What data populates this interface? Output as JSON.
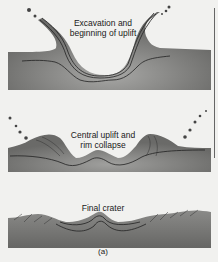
{
  "figure": {
    "stages": [
      {
        "label_line1": "Excavation and",
        "label_line2": "beginning of uplift"
      },
      {
        "label_line1": "Central uplift and",
        "label_line2": "rim collapse"
      },
      {
        "label_line1": "Final crater",
        "label_line2": ""
      }
    ],
    "caption": "(a)",
    "colors": {
      "ground": "#6e6e6c",
      "ground_light": "#9a9a98",
      "background": "#f1f1ef",
      "line": "#222222"
    }
  }
}
